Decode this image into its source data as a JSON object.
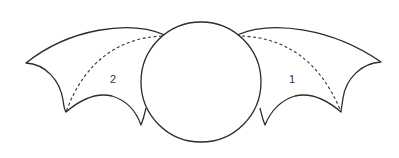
{
  "diagram": {
    "title": "",
    "colors": {
      "stroke": "#2b2b2b",
      "fill": "#ffffff",
      "dashed": "#333333"
    },
    "shapes": {
      "body": {
        "type": "circle",
        "cx": 201,
        "cy": 82,
        "r": 60
      },
      "left_wing": {
        "label": "2"
      },
      "right_wing": {
        "label": "1"
      }
    },
    "labels": [
      {
        "text": "2",
        "x": 110,
        "y": 74
      },
      {
        "text": "1",
        "x": 289,
        "y": 74
      }
    ]
  }
}
